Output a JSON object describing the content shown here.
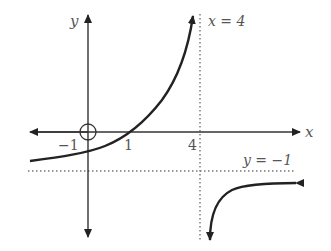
{
  "figure": {
    "axes": {
      "x_label": "x",
      "y_label": "y",
      "tick_labels": {
        "neg_one": "−1",
        "one": "1",
        "four": "4"
      }
    },
    "asymptotes": {
      "vertical_label": "x = 4",
      "horizontal_label": "y = −1"
    },
    "colors": {
      "curve": "#222222",
      "axis": "#333333",
      "asymptote": "#777777",
      "label": "#555555"
    }
  }
}
